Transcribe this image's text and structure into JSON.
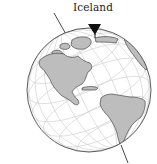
{
  "figure": {
    "label": "Iceland",
    "colors": {
      "land": "#bdbdbd",
      "ocean": "#ffffff",
      "graticule": "#c8c8c8",
      "outline": "#333333",
      "arrow": "#111111"
    }
  }
}
